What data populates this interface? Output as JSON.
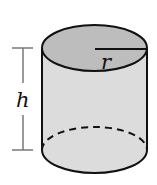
{
  "figure": {
    "type": "cylinder",
    "labels": {
      "radius": "r",
      "height": "h"
    },
    "colors": {
      "top_face": "#bdbdbd",
      "side_face": "#dcdcdc",
      "stroke": "#111111",
      "dimension_line": "#777777",
      "background": "#ffffff"
    }
  }
}
